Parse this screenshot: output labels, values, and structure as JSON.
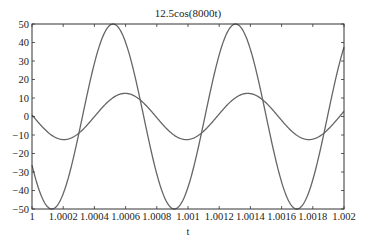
{
  "chart_data": {
    "type": "line",
    "title": "12.5cos(8000t)",
    "xlabel": "t",
    "ylabel": "",
    "xlim": [
      1,
      1.002
    ],
    "ylim": [
      -50,
      50
    ],
    "grid": false,
    "legend": null,
    "x_ticks": [
      "1",
      "1.0002",
      "1.0004",
      "1.0006",
      "1.0008",
      "1.001",
      "1.0012",
      "1.0014",
      "1.0016",
      "1.0018",
      "1.002"
    ],
    "y_ticks": [
      "50",
      "40",
      "30",
      "20",
      "10",
      "0",
      "-10",
      "-20",
      "-30",
      "-40",
      "-50"
    ],
    "series": [
      {
        "name": "12.5cos(8000t)",
        "amplitude": 12.5,
        "omega": 8000,
        "phase": 0,
        "color": "#666666",
        "x": [
          1,
          1.0002,
          1.0004,
          1.0006,
          1.0008,
          1.001,
          1.0012,
          1.0014,
          1.0016,
          1.0018,
          1.002
        ],
        "values": [
          0.8,
          -12.5,
          -4.9,
          12.5,
          6.0,
          -10.7,
          -9.6,
          7.5,
          11.7,
          -3.2,
          -12.5
        ]
      },
      {
        "name": "50cos(8000t+phi)",
        "amplitude": 50,
        "omega": 8000,
        "phase": 0.62,
        "color": "#666666",
        "x": [
          1,
          1.0002,
          1.0004,
          1.0006,
          1.0008,
          1.001,
          1.0012,
          1.0014,
          1.0016,
          1.0018,
          1.002
        ],
        "values": [
          -27,
          -49,
          25,
          45,
          -12,
          -48,
          20,
          48,
          -38,
          -35,
          38
        ]
      }
    ]
  }
}
